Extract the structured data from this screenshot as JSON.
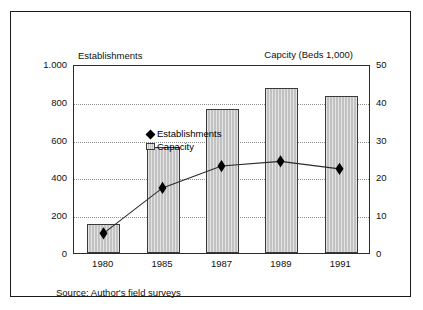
{
  "chart_data": {
    "type": "bar",
    "title": "",
    "categories": [
      "1980",
      "1985",
      "1987",
      "1989",
      "1991"
    ],
    "series": [
      {
        "name": "Capacity",
        "type": "bar",
        "axis": "right",
        "values": [
          7.7,
          28.0,
          38.0,
          43.7,
          41.5
        ]
      },
      {
        "name": "Establishments",
        "type": "line",
        "axis": "left",
        "marker": "diamond",
        "values": [
          105,
          348,
          465,
          490,
          450
        ]
      }
    ],
    "xlabel": "",
    "ylabel": "Establishments",
    "y2label": "Capcity (Beds 1,000)",
    "ylim": [
      0,
      1000
    ],
    "y2lim": [
      0,
      50
    ],
    "yticks": [
      "0",
      "200",
      "400",
      "600",
      "800",
      "1.000"
    ],
    "ytick_values": [
      0,
      200,
      400,
      600,
      800,
      1000
    ],
    "y2ticks": [
      "0",
      "10",
      "20",
      "30",
      "40",
      "50"
    ],
    "y2tick_values": [
      0,
      10,
      20,
      30,
      40,
      50
    ],
    "grid": "horizontal-dotted",
    "legend_position": "top-left-inside",
    "legend": [
      "Establishments",
      "Capacity"
    ],
    "annotations": [
      "Source: Author's field surveys"
    ],
    "colors": {
      "bar_fill": "#c2c2c2",
      "bar_stroke": "#3a3a3a",
      "line": "#2b2b2b",
      "marker": "#000000",
      "grid": "#8e8e8e",
      "axis": "#2b2b2b",
      "frame": "#1a1a1a",
      "text": "#111111",
      "background": "#ffffff"
    }
  },
  "axis_titles": {
    "left": "Establishments",
    "right": "Capcity (Beds 1,000)"
  },
  "legend": {
    "establishments_label": "Establishments",
    "capacity_label": "Capacity"
  },
  "source": {
    "text": "Source: Author's field surveys"
  }
}
